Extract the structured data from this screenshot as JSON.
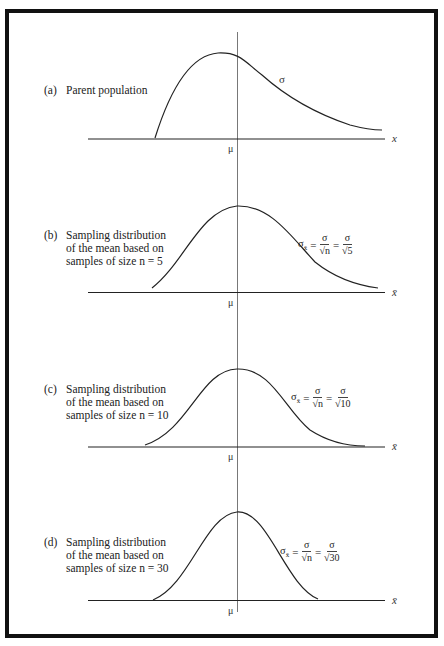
{
  "chart_data": [
    {
      "type": "line",
      "panel": "a",
      "title": "(a) Parent population",
      "label_lines": [
        "Parent population"
      ],
      "xlabel": "x",
      "center_label": "μ",
      "annotation": "σ",
      "shape": "right-skewed",
      "axis_y": 138,
      "peak": {
        "x": 218,
        "y": 53
      },
      "path": "M155,138 C170,90 190,55 218,53 C240,52 245,62 262,75 C290,100 320,115 350,125 C365,129 375,130 382,130"
    },
    {
      "type": "line",
      "panel": "b",
      "title": "(b) Sampling distribution of the mean based on samples of size n = 5",
      "label_lines": [
        "Sampling distribution",
        "of the mean based on",
        "samples of size n = 5"
      ],
      "xlabel": "x̄",
      "center_label": "μ",
      "n": 5,
      "formula": {
        "lhs": "σ",
        "lhs_sub": "x̄",
        "mid_num": "σ",
        "mid_den": "√n",
        "rhs_num": "σ",
        "rhs_den": "√5"
      },
      "shape": "slightly right-skewed",
      "axis_y": 292,
      "peak": {
        "x": 237,
        "y": 206
      },
      "path": "M152,288 C185,262 200,210 237,206 C270,205 290,235 315,262 C335,278 355,285 378,288"
    },
    {
      "type": "line",
      "panel": "c",
      "title": "(c) Sampling distribution of the mean based on samples of size n = 10",
      "label_lines": [
        "Sampling distribution",
        "of the mean based on",
        "samples of size n = 10"
      ],
      "xlabel": "x̄",
      "center_label": "μ",
      "n": 10,
      "formula": {
        "lhs": "σ",
        "lhs_sub": "x̄",
        "mid_num": "σ",
        "mid_den": "√n",
        "rhs_num": "σ",
        "rhs_den": "√10"
      },
      "shape": "nearly normal",
      "axis_y": 447,
      "peak": {
        "x": 237,
        "y": 369
      },
      "path": "M145,445 C190,430 200,370 237,369 C272,368 285,410 310,430 C330,443 350,446 365,446"
    },
    {
      "type": "line",
      "panel": "d",
      "title": "(d) Sampling distribution of the mean based on samples of size n = 30",
      "label_lines": [
        "Sampling distribution",
        "of the mean based on",
        "samples of size n = 30"
      ],
      "xlabel": "x̄",
      "center_label": "μ",
      "n": 30,
      "formula": {
        "lhs": "σ",
        "lhs_sub": "x̄",
        "mid_num": "σ",
        "mid_den": "√n",
        "rhs_num": "σ",
        "rhs_den": "√30"
      },
      "shape": "normal, narrow",
      "axis_y": 600,
      "peak": {
        "x": 237,
        "y": 512
      },
      "path": "M153,600 C190,585 205,515 237,512 C268,510 285,585 318,599"
    }
  ],
  "panels": {
    "a": {
      "tag": "(a)",
      "lines": [
        "Parent population"
      ],
      "mu": "μ",
      "xlabel": "x",
      "sigma": "σ"
    },
    "b": {
      "tag": "(b)",
      "lines": [
        "Sampling distribution",
        "of the mean based on",
        "samples of size n = 5"
      ],
      "mu": "μ",
      "xlabel": "x̄",
      "f_lhs": "σ",
      "f_sub": "x̄",
      "f_num1": "σ",
      "f_den1": "√n",
      "f_num2": "σ",
      "f_den2": "√5"
    },
    "c": {
      "tag": "(c)",
      "lines": [
        "Sampling distribution",
        "of the mean based on",
        "samples of size n = 10"
      ],
      "mu": "μ",
      "xlabel": "x̄",
      "f_lhs": "σ",
      "f_sub": "x̄",
      "f_num1": "σ",
      "f_den1": "√n",
      "f_num2": "σ",
      "f_den2": "√10"
    },
    "d": {
      "tag": "(d)",
      "lines": [
        "Sampling distribution",
        "of the mean based on",
        "samples of size n = 30"
      ],
      "mu": "μ",
      "xlabel": "x̄",
      "f_lhs": "σ",
      "f_sub": "x̄",
      "f_num1": "σ",
      "f_den1": "√n",
      "f_num2": "σ",
      "f_den2": "√30"
    }
  },
  "equals": "="
}
